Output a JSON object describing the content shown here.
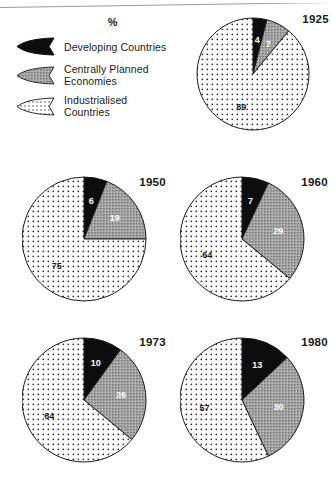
{
  "legend": {
    "title": "%",
    "items": [
      {
        "label": "Developing Countries",
        "icon": "wedge-icon",
        "key": "developing",
        "fill": "solid-black"
      },
      {
        "label": "Centrally Planned\nEconomies",
        "icon": "wedge-icon",
        "key": "centrally",
        "fill": "grey-stipple"
      },
      {
        "label": "Industrialised Countries",
        "icon": "wedge-icon",
        "key": "industrialised",
        "fill": "white-dotted"
      }
    ]
  },
  "colors": {
    "developing": "#0d0d0d",
    "centrally": "#8c8c8c",
    "industrialised": "#ffffff",
    "outline": "#1a1a1a",
    "text": "#1a1a1a",
    "label_on_dark": "#ffffff",
    "label_on_light": "#1a1a1a"
  },
  "chart_data": [
    {
      "type": "pie",
      "title": "1925",
      "categories": [
        "Developing Countries",
        "Centrally Planned Economies",
        "Industrialised Countries"
      ],
      "values": [
        4,
        7,
        89
      ],
      "labels": [
        "4",
        "7",
        "89"
      ],
      "xlabel": "",
      "ylabel": "",
      "legend_position": "top-left",
      "units": "%"
    },
    {
      "type": "pie",
      "title": "1950",
      "categories": [
        "Developing Countries",
        "Centrally Planned Economies",
        "Industrialised Countries"
      ],
      "values": [
        6,
        19,
        75
      ],
      "labels": [
        "6",
        "19",
        "75"
      ],
      "xlabel": "",
      "ylabel": "",
      "legend_position": "top-left",
      "units": "%"
    },
    {
      "type": "pie",
      "title": "1960",
      "categories": [
        "Developing Countries",
        "Centrally Planned Economies",
        "Industrialised Countries"
      ],
      "values": [
        7,
        29,
        64
      ],
      "labels": [
        "7",
        "29",
        "64"
      ],
      "xlabel": "",
      "ylabel": "",
      "legend_position": "top-left",
      "units": "%"
    },
    {
      "type": "pie",
      "title": "1973",
      "categories": [
        "Developing Countries",
        "Centrally Planned Economies",
        "Industrialised Countries"
      ],
      "values": [
        10,
        26,
        64
      ],
      "labels": [
        "10",
        "26",
        "64"
      ],
      "xlabel": "",
      "ylabel": "",
      "legend_position": "top-left",
      "units": "%"
    },
    {
      "type": "pie",
      "title": "1980",
      "categories": [
        "Developing Countries",
        "Centrally Planned Economies",
        "Industrialised Countries"
      ],
      "values": [
        13,
        30,
        57
      ],
      "labels": [
        "13",
        "30",
        "57"
      ],
      "xlabel": "",
      "ylabel": "",
      "legend_position": "top-left",
      "units": "%"
    }
  ]
}
